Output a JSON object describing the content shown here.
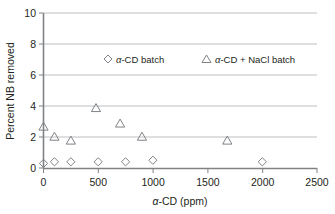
{
  "chart_data": {
    "type": "scatter",
    "title": "",
    "xlabel": "α-CD (ppm)",
    "ylabel": "Percent NB removed",
    "xlim": [
      0,
      2500
    ],
    "ylim": [
      0,
      10
    ],
    "xticks": [
      0,
      500,
      1000,
      1500,
      2000,
      2500
    ],
    "yticks": [
      0,
      2,
      4,
      6,
      8,
      10
    ],
    "xtick_labels": [
      "0",
      "500",
      "1000",
      "1500",
      "2000",
      "2500"
    ],
    "ytick_labels": [
      "0",
      "2",
      "4",
      "6",
      "8",
      "10"
    ],
    "grid": "horizontal",
    "legend_position": "inside-top-center",
    "series": [
      {
        "name": "α-CD batch",
        "marker": "diamond",
        "points": [
          {
            "x": 0,
            "y": 0.3
          },
          {
            "x": 100,
            "y": 0.4
          },
          {
            "x": 250,
            "y": 0.4
          },
          {
            "x": 500,
            "y": 0.4
          },
          {
            "x": 750,
            "y": 0.4
          },
          {
            "x": 1000,
            "y": 0.5
          },
          {
            "x": 2000,
            "y": 0.4
          }
        ]
      },
      {
        "name": "α-CD + NaCl batch",
        "marker": "triangle",
        "points": [
          {
            "x": 0,
            "y": 2.7
          },
          {
            "x": 100,
            "y": 2.05
          },
          {
            "x": 250,
            "y": 1.8
          },
          {
            "x": 480,
            "y": 3.9
          },
          {
            "x": 700,
            "y": 2.9
          },
          {
            "x": 900,
            "y": 2.05
          },
          {
            "x": 1680,
            "y": 1.8
          }
        ]
      }
    ]
  },
  "axis": {
    "y_title_parts": {
      "text": "Percent NB removed"
    },
    "x_title_parts": {
      "symbol": "α",
      "rest": "-CD (ppm)"
    }
  },
  "legend": {
    "entries": [
      {
        "marker": "diamond",
        "symbol": "α",
        "rest": "-CD batch"
      },
      {
        "marker": "triangle",
        "symbol": "α",
        "rest": "-CD + NaCl batch"
      }
    ]
  },
  "colors": {
    "axis": "#808285",
    "grid": "#bcbec0",
    "marker": "#808285",
    "text": "#231f20",
    "background": "#ffffff"
  }
}
